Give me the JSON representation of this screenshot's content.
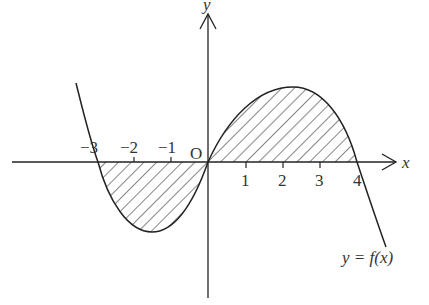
{
  "diagram": {
    "axes": {
      "x_label": "x",
      "y_label": "y",
      "origin_label": "O"
    },
    "ticks": {
      "negative": [
        "−3",
        "−2",
        "−1"
      ],
      "positive": [
        "1",
        "2",
        "3",
        "4"
      ]
    },
    "curve_label": "y = f(x)",
    "roots": [
      -3,
      0,
      4
    ],
    "shaded_regions": [
      {
        "from": -3,
        "to": 0,
        "side": "below x-axis"
      },
      {
        "from": 0,
        "to": 4,
        "side": "above x-axis"
      }
    ],
    "colors": {
      "line": "#222222",
      "background": "#ffffff"
    }
  }
}
